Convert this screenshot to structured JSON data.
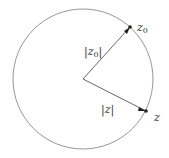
{
  "diagram": {
    "type": "circle-with-radii",
    "circle": {
      "cx": 83,
      "cy": 79,
      "r": 70,
      "stroke": "#888888"
    },
    "center": {
      "x": 83,
      "y": 79
    },
    "points": [
      {
        "name": "z0",
        "x": 130,
        "y": 27
      },
      {
        "name": "z",
        "x": 146,
        "y": 111
      }
    ],
    "labels": {
      "point_z0": {
        "base": "z",
        "sub": "0"
      },
      "point_z": {
        "base": "z"
      },
      "radius_z0": {
        "text": "|z",
        "sub": "0",
        "close": "|"
      },
      "radius_z": {
        "text": "|z|"
      }
    },
    "line_color": "#555555",
    "point_color": "#222222"
  }
}
